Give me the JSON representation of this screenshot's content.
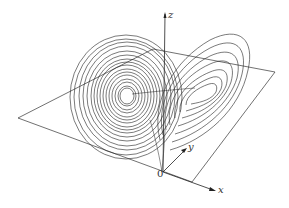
{
  "diagram": {
    "axes": {
      "x": "x",
      "y": "y",
      "z": "z",
      "origin": "0"
    },
    "colors": {
      "curve": "#222222",
      "plane": "#333333",
      "background": "#ffffff"
    }
  }
}
